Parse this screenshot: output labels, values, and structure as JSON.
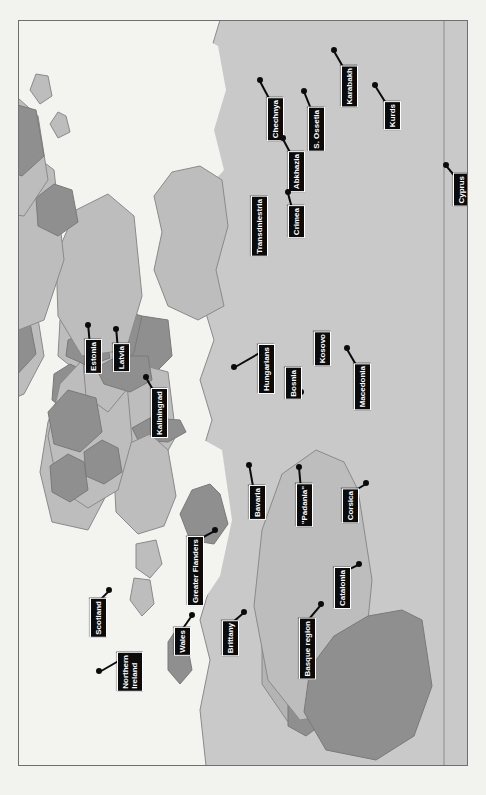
{
  "map": {
    "title": "Separatist and autonomist regions of Europe and the Near East",
    "orientation": "rotated-90-clockwise",
    "frame": {
      "border_color": "#6f6f6f",
      "background": "#f4f4f1"
    },
    "colors": {
      "page_background": "#f2f2ef",
      "sea": "#f3f3f0",
      "land_light": "#c9c9c9",
      "land_mid": "#b2b2b2",
      "highlight_region": "#8f8f8f",
      "border_line": "#8a8a8a",
      "label_background": "#0b0b0b",
      "label_text": "#ffffff",
      "label_border": "#ffffff"
    },
    "labels": [
      {
        "id": "chechnya",
        "text": "Chechnya",
        "x": 266,
        "y": 96,
        "leader": {
          "len": 26,
          "angle": -118
        }
      },
      {
        "id": "abkhazia",
        "text": "Abkhazia",
        "x": 287,
        "y": 150,
        "leader": {
          "len": 22,
          "angle": -118
        }
      },
      {
        "id": "s-ossetia",
        "text": "S. Ossetia",
        "x": 307,
        "y": 106,
        "leader": {
          "len": 24,
          "angle": -112
        }
      },
      {
        "id": "karabakh",
        "text": "Karabakh",
        "x": 340,
        "y": 64,
        "leader": {
          "len": 24,
          "angle": -120
        }
      },
      {
        "id": "kurds",
        "text": "Kurds",
        "x": 383,
        "y": 100,
        "leader": {
          "len": 26,
          "angle": -122
        }
      },
      {
        "id": "cyprus",
        "text": "Cyprus",
        "x": 452,
        "y": 172,
        "leader": {
          "len": 18,
          "angle": -130
        }
      },
      {
        "id": "transdniestria",
        "text": "Transdniestria",
        "x": 250,
        "y": 195,
        "leader": {
          "len": 42,
          "angle": 90
        }
      },
      {
        "id": "crimea",
        "text": "Crimea",
        "x": 287,
        "y": 204,
        "leader": {
          "len": 20,
          "angle": -105
        }
      },
      {
        "id": "kosovo",
        "text": "Kosovo",
        "x": 313,
        "y": 330,
        "leader": {
          "len": 24,
          "angle": 70
        }
      },
      {
        "id": "macedonia",
        "text": "Macedonia",
        "x": 353,
        "y": 362,
        "leader": {
          "len": 24,
          "angle": -120
        }
      },
      {
        "id": "bosnia",
        "text": "Bosnia",
        "x": 284,
        "y": 366,
        "leader": {
          "len": 22,
          "angle": 60
        }
      },
      {
        "id": "hungarians",
        "text": "Hungarians",
        "x": 257,
        "y": 343,
        "leader": {
          "len": 34,
          "angle": 150
        }
      },
      {
        "id": "estonia",
        "text": "Estonia",
        "x": 84,
        "y": 338,
        "leader": {
          "len": 20,
          "angle": -95
        }
      },
      {
        "id": "latvia",
        "text": "Latvia",
        "x": 112,
        "y": 342,
        "leader": {
          "len": 20,
          "angle": -95
        }
      },
      {
        "id": "kaliningrad",
        "text": "Kaliningrad",
        "x": 150,
        "y": 387,
        "leader": {
          "len": 20,
          "angle": -120
        }
      },
      {
        "id": "bavaria",
        "text": "Bavaria",
        "x": 248,
        "y": 484,
        "leader": {
          "len": 26,
          "angle": -100
        }
      },
      {
        "id": "padania",
        "text": "\"Padania\"",
        "x": 295,
        "y": 482,
        "leader": {
          "len": 22,
          "angle": -95
        }
      },
      {
        "id": "corsica",
        "text": "Corsica",
        "x": 341,
        "y": 487,
        "leader": {
          "len": 22,
          "angle": -30
        }
      },
      {
        "id": "catalonia",
        "text": "Catalonia",
        "x": 333,
        "y": 566,
        "leader": {
          "len": 22,
          "angle": -25
        }
      },
      {
        "id": "basque-region",
        "text": "Basque region",
        "x": 298,
        "y": 617,
        "leader": {
          "len": 26,
          "angle": -50
        }
      },
      {
        "id": "greater-flanders",
        "text": "Greater Flanders",
        "x": 186,
        "y": 535,
        "leader": {
          "len": 26,
          "angle": -28
        }
      },
      {
        "id": "scotland",
        "text": "Scotland",
        "x": 89,
        "y": 597,
        "leader": {
          "len": 20,
          "angle": -45
        }
      },
      {
        "id": "northern-ireland",
        "text": "Northern\nIreland",
        "x": 116,
        "y": 651,
        "leader": {
          "len": 26,
          "angle": 150
        }
      },
      {
        "id": "wales",
        "text": "Wales",
        "x": 173,
        "y": 626,
        "leader": {
          "len": 22,
          "angle": -55
        }
      },
      {
        "id": "brittany",
        "text": "Brittany",
        "x": 221,
        "y": 619,
        "leader": {
          "len": 22,
          "angle": -40
        }
      }
    ]
  }
}
